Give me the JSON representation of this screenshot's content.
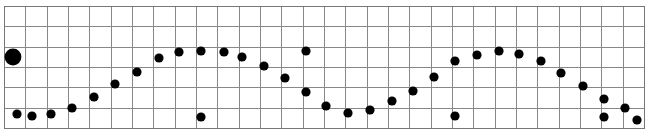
{
  "chart_data": {
    "type": "scatter",
    "title": "",
    "subtitle": "",
    "xlabel": "",
    "ylabel": "",
    "grid": true,
    "grid_columns": 30,
    "grid_rows": 6,
    "legend": "none",
    "xlim": [
      0,
      30
    ],
    "ylim": [
      0,
      6
    ],
    "plot_area": {
      "x": 4,
      "y": 6,
      "width": 640,
      "height": 122
    },
    "colors": {
      "marker": "#000000",
      "grid_line": "#888888",
      "border": "#777777",
      "background": "#ffffff"
    },
    "marker_radius_default": 4.6,
    "series": [
      {
        "name": "wave",
        "marker": "filled-circle",
        "points": [
          {
            "x": 0.42,
            "y": 3.52,
            "px": 13,
            "py": 57,
            "r": 8.4
          },
          {
            "x": 2.22,
            "y": 0.72,
            "px": 51,
            "py": 114,
            "r": 4.6
          },
          {
            "x": 3.23,
            "y": 1.02,
            "px": 72,
            "py": 108,
            "r": 4.6
          },
          {
            "x": 4.25,
            "y": 1.55,
            "px": 94,
            "py": 97,
            "r": 4.6
          },
          {
            "x": 5.25,
            "y": 2.22,
            "px": 115,
            "py": 84,
            "r": 4.6
          },
          {
            "x": 6.28,
            "y": 2.81,
            "px": 137,
            "py": 72,
            "r": 4.6
          },
          {
            "x": 7.3,
            "y": 3.5,
            "px": 159,
            "py": 58,
            "r": 4.6
          },
          {
            "x": 8.28,
            "y": 3.82,
            "px": 179,
            "py": 52,
            "r": 4.6
          },
          {
            "x": 9.3,
            "y": 3.86,
            "px": 201,
            "py": 51,
            "r": 4.6
          },
          {
            "x": 10.4,
            "y": 3.82,
            "px": 224,
            "py": 52,
            "r": 4.6
          },
          {
            "x": 11.25,
            "y": 3.54,
            "px": 242,
            "py": 57,
            "r": 4.6
          },
          {
            "x": 12.3,
            "y": 3.11,
            "px": 264,
            "py": 66,
            "r": 4.6
          },
          {
            "x": 13.3,
            "y": 2.52,
            "px": 285,
            "py": 78,
            "r": 4.6
          },
          {
            "x": 14.3,
            "y": 1.8,
            "px": 306,
            "py": 92,
            "r": 4.6
          },
          {
            "x": 15.25,
            "y": 1.12,
            "px": 326,
            "py": 106,
            "r": 4.6
          },
          {
            "x": 16.3,
            "y": 0.78,
            "px": 348,
            "py": 113,
            "r": 4.6
          },
          {
            "x": 17.3,
            "y": 0.92,
            "px": 370,
            "py": 110,
            "r": 4.6
          },
          {
            "x": 18.35,
            "y": 1.35,
            "px": 392,
            "py": 101,
            "r": 4.6
          },
          {
            "x": 19.35,
            "y": 1.86,
            "px": 413,
            "py": 91,
            "r": 4.6
          },
          {
            "x": 20.3,
            "y": 2.55,
            "px": 434,
            "py": 77,
            "r": 4.6
          },
          {
            "x": 21.3,
            "y": 3.35,
            "px": 455,
            "py": 61,
            "r": 4.6
          },
          {
            "x": 22.35,
            "y": 3.62,
            "px": 477,
            "py": 55,
            "r": 4.6
          },
          {
            "x": 23.4,
            "y": 3.86,
            "px": 499,
            "py": 51,
            "r": 4.6
          },
          {
            "x": 24.35,
            "y": 3.65,
            "px": 519,
            "py": 54,
            "r": 4.6
          },
          {
            "x": 25.35,
            "y": 3.35,
            "px": 541,
            "py": 61,
            "r": 4.6
          },
          {
            "x": 26.3,
            "y": 2.75,
            "px": 561,
            "py": 73,
            "r": 4.6
          },
          {
            "x": 27.35,
            "y": 2.12,
            "px": 583,
            "py": 86,
            "r": 4.6
          },
          {
            "x": 28.3,
            "y": 1.48,
            "px": 604,
            "py": 99,
            "r": 4.6
          },
          {
            "x": 29.3,
            "y": 1.02,
            "px": 625,
            "py": 108,
            "r": 4.6
          }
        ]
      },
      {
        "name": "baseline",
        "marker": "filled-circle",
        "points": [
          {
            "x": 0.62,
            "y": 0.72,
            "px": 17,
            "py": 114,
            "r": 4.6
          },
          {
            "x": 1.3,
            "y": 0.62,
            "px": 32,
            "py": 116,
            "r": 4.6
          },
          {
            "x": 9.3,
            "y": 0.6,
            "px": 201,
            "py": 117,
            "r": 4.6
          },
          {
            "x": 14.3,
            "y": 3.88,
            "px": 306,
            "py": 51,
            "r": 4.6
          },
          {
            "x": 21.3,
            "y": 0.62,
            "px": 455,
            "py": 116,
            "r": 4.6
          },
          {
            "x": 28.3,
            "y": 0.58,
            "px": 604,
            "py": 117,
            "r": 4.6
          },
          {
            "x": 29.8,
            "y": 0.45,
            "px": 637,
            "py": 120,
            "r": 4.6
          }
        ]
      }
    ]
  }
}
